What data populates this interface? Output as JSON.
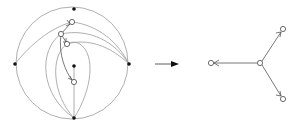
{
  "figure": {
    "colors": {
      "background": "#ffffff",
      "curve_stroke": "#9a9a9a",
      "edge_stroke": "#555555",
      "marked_point": "#111111",
      "vertex_fill": "#ffffff"
    }
  },
  "left_diagram": {
    "disk": {
      "cx": 74,
      "cy": 63,
      "r": 55
    },
    "marked_points": [
      {
        "name": "top",
        "x": 74,
        "y": 9
      },
      {
        "name": "left",
        "x": 15,
        "y": 64
      },
      {
        "name": "right",
        "x": 129,
        "y": 64
      },
      {
        "name": "bottom",
        "x": 74,
        "y": 118
      },
      {
        "name": "interior",
        "x": 74,
        "y": 66
      }
    ],
    "vertices": [
      {
        "name": "v1",
        "x": 72,
        "y": 22
      },
      {
        "name": "v2",
        "x": 61,
        "y": 34
      },
      {
        "name": "v3",
        "x": 67,
        "y": 44
      },
      {
        "name": "v4",
        "x": 74,
        "y": 82
      }
    ]
  },
  "transition_arrow": {
    "x1": 155,
    "y1": 64,
    "x2": 178,
    "y2": 64
  },
  "right_diagram": {
    "center": {
      "x": 260,
      "y": 63
    },
    "leaves": [
      {
        "name": "left",
        "x": 211,
        "y": 63
      },
      {
        "name": "upper-right",
        "x": 283,
        "y": 29
      },
      {
        "name": "lower-right",
        "x": 283,
        "y": 99
      }
    ]
  }
}
